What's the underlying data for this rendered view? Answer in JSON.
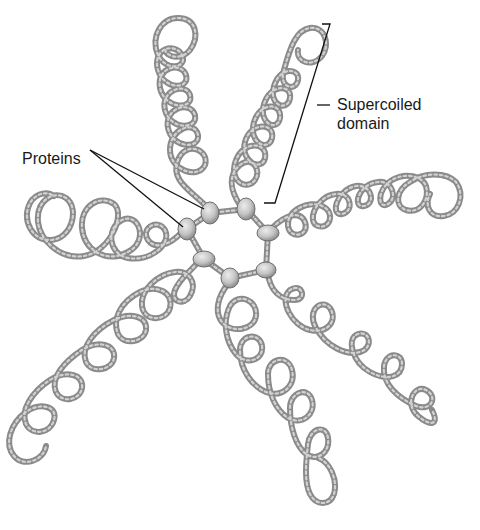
{
  "figure": {
    "labels": {
      "proteins": "Proteins",
      "supercoiled_domain_line1": "Supercoiled",
      "supercoiled_domain_line2": "domain"
    },
    "colors": {
      "dna_strand": "#8a8a8a",
      "dna_highlight": "#cfcfcf",
      "protein_fill": "#c4c4c4",
      "protein_stroke": "#6e6e6e",
      "leader_line": "#111111",
      "text": "#1a1a1a"
    },
    "proteins": [
      {
        "cx": 210,
        "cy": 213
      },
      {
        "cx": 246,
        "cy": 209
      },
      {
        "cx": 268,
        "cy": 233
      },
      {
        "cx": 187,
        "cy": 229
      },
      {
        "cx": 204,
        "cy": 259
      },
      {
        "cx": 230,
        "cy": 278
      },
      {
        "cx": 266,
        "cy": 270
      }
    ],
    "loop_domains": [
      {
        "name": "top-left-arm",
        "direction": "up"
      },
      {
        "name": "top-right-arm",
        "direction": "up-right"
      },
      {
        "name": "right-arm",
        "direction": "right"
      },
      {
        "name": "left-arm",
        "direction": "left"
      },
      {
        "name": "bottom-left-arm",
        "direction": "down-left"
      },
      {
        "name": "bottom-center-arm",
        "direction": "down"
      },
      {
        "name": "bottom-right-arm",
        "direction": "down-right"
      }
    ]
  }
}
